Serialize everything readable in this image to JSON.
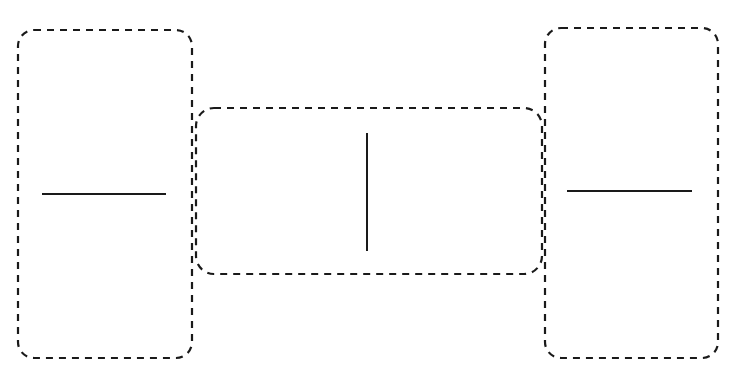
{
  "diagram": {
    "background": "#ffffff",
    "stroke_color": "#1a1a1a",
    "boxes": [
      {
        "id": "left-box",
        "x": 18,
        "y": 30,
        "w": 174,
        "h": 328,
        "rx": 16,
        "dashed": true
      },
      {
        "id": "middle-box",
        "x": 196,
        "y": 108,
        "w": 346,
        "h": 166,
        "rx": 18,
        "dashed": true
      },
      {
        "id": "right-box",
        "x": 545,
        "y": 28,
        "w": 173,
        "h": 330,
        "rx": 16,
        "dashed": true
      }
    ],
    "lines": [
      {
        "id": "left-horizontal-line",
        "x1": 42,
        "y1": 194,
        "x2": 166,
        "y2": 194
      },
      {
        "id": "middle-vertical-line",
        "x1": 367,
        "y1": 133,
        "x2": 367,
        "y2": 251
      },
      {
        "id": "right-horizontal-line",
        "x1": 567,
        "y1": 191,
        "x2": 692,
        "y2": 191
      }
    ]
  }
}
